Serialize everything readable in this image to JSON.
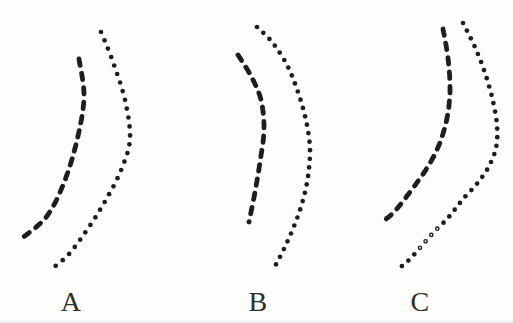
{
  "figure": {
    "background_color": "#fdfdfc",
    "ink_color": "#1d1d1d",
    "label_color": "#2e2e2e",
    "style": {
      "dash_width": 4.8,
      "dash_len": 6.5,
      "dash_gap": 8,
      "dot_radius": 2.35,
      "dot_spacing": 8.8,
      "hollow_ring_width": 1.4
    },
    "panels": [
      {
        "label": "A",
        "label_x": 71,
        "label_top": 288,
        "dashed_curve": {
          "points": [
            [
              79,
              59
            ],
            [
              84,
              96
            ],
            [
              78,
              136
            ],
            [
              65,
              180
            ],
            [
              47,
              216
            ],
            [
              21,
              239
            ]
          ]
        },
        "dotted_curve": {
          "points": [
            [
              101,
              32
            ],
            [
              113,
              62
            ],
            [
              125,
              100
            ],
            [
              130,
              138
            ],
            [
              122,
              168
            ],
            [
              107,
              198
            ],
            [
              89,
              227
            ],
            [
              69,
              254
            ],
            [
              53,
              268
            ]
          ],
          "spacing": 9.0
        }
      },
      {
        "label": "B",
        "label_x": 258,
        "label_top": 288,
        "dashed_curve": {
          "points": [
            [
              238,
              55
            ],
            [
              251,
              76
            ],
            [
              261,
              100
            ],
            [
              264,
              130
            ],
            [
              260,
              162
            ],
            [
              255,
              192
            ],
            [
              249,
              222
            ]
          ]
        },
        "dotted_curve": {
          "points": [
            [
              257,
              27
            ],
            [
              272,
              42
            ],
            [
              287,
              65
            ],
            [
              299,
              95
            ],
            [
              307,
              125
            ],
            [
              310,
              152
            ],
            [
              307,
              183
            ],
            [
              300,
              210
            ],
            [
              292,
              231
            ],
            [
              283,
              251
            ],
            [
              274,
              268
            ]
          ],
          "spacing": 8.6
        }
      },
      {
        "label": "C",
        "label_x": 420,
        "label_top": 288,
        "dashed_curve": {
          "points": [
            [
              443,
              29
            ],
            [
              448,
              58
            ],
            [
              450,
              90
            ],
            [
              447,
              118
            ],
            [
              439,
              145
            ],
            [
              427,
              168
            ],
            [
              410,
              192
            ],
            [
              395,
              211
            ],
            [
              386,
              219
            ]
          ]
        },
        "dotted_curve": {
          "points": [
            [
              463,
              23
            ],
            [
              474,
              45
            ],
            [
              484,
              70
            ],
            [
              492,
              97
            ],
            [
              497,
              125
            ],
            [
              496,
              148
            ],
            [
              488,
              168
            ],
            [
              476,
              185
            ],
            [
              463,
              199
            ],
            [
              448,
              218
            ],
            [
              433,
              233
            ],
            [
              419,
              249
            ],
            [
              408,
              261
            ],
            [
              398,
              269
            ]
          ],
          "spacing": 8.6,
          "hollow_dots": [
            [
              438,
              228
            ],
            [
              433,
              233
            ],
            [
              428,
              240
            ],
            [
              423,
              245
            ]
          ]
        }
      }
    ]
  }
}
